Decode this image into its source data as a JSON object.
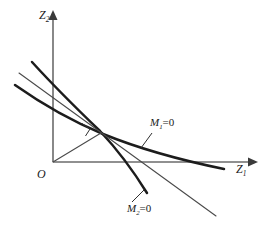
{
  "figure": {
    "background_color": "#ffffff",
    "axes": {
      "y_axis": {
        "label_symbol": "Z",
        "label_subscript": "2",
        "icon": "up-arrow-axis-icon"
      },
      "x_axis": {
        "label_symbol": "Z",
        "label_subscript": "1",
        "icon": "right-arrow-axis-icon"
      },
      "origin": {
        "label": "O"
      },
      "axis_color": "#6b6b6b"
    },
    "curves": [
      {
        "name": "m1-curve",
        "label_symbol": "M",
        "label_subscript": "1",
        "label_rhs": "=0",
        "style": "thick",
        "color": "#1c1c1c"
      },
      {
        "name": "m2-curve",
        "label_symbol": "M",
        "label_subscript": "2",
        "label_rhs": "=0",
        "style": "thick",
        "color": "#1c1c1c"
      },
      {
        "name": "tangent-line",
        "style": "thin",
        "color": "#4a4a4a"
      },
      {
        "name": "ray-from-origin",
        "style": "thin",
        "color": "#4a4a4a"
      }
    ],
    "markers": {
      "right_angle": {
        "name": "right-angle-marker",
        "description": "perpendicularity square at intersection of ray and tangent"
      }
    }
  }
}
